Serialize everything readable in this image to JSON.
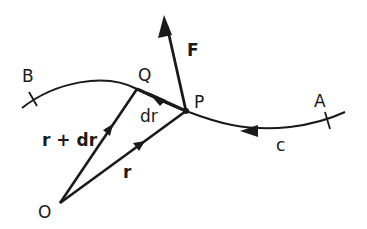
{
  "diagram": {
    "colors": {
      "ink": "#1a1a1a",
      "background": "#ffffff"
    },
    "points": {
      "O": {
        "label": "O"
      },
      "P": {
        "label": "P"
      },
      "Q": {
        "label": "Q"
      },
      "A": {
        "label": "A"
      },
      "B": {
        "label": "B"
      }
    },
    "curve": {
      "label": "c"
    },
    "vectors": {
      "force": {
        "label": "F"
      },
      "r": {
        "label": "r"
      },
      "r_plus_dr": {
        "label": "r + dr"
      },
      "dr": {
        "label": "dr"
      }
    }
  }
}
